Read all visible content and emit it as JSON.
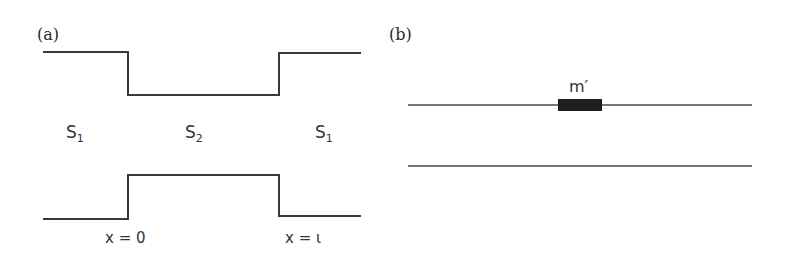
{
  "panel_a": {
    "label": "(a)",
    "regions": [
      {
        "base": "S",
        "sub": "1"
      },
      {
        "base": "S",
        "sub": "2"
      },
      {
        "base": "S",
        "sub": "1"
      }
    ],
    "boundaries": [
      {
        "label": "x = 0"
      },
      {
        "label": "x = ι"
      }
    ]
  },
  "panel_b": {
    "label": "(b)",
    "mass_label": "m′"
  },
  "colors": {
    "line": "#3a3a3a",
    "block": "#1e1e1e",
    "background": "#ffffff"
  }
}
